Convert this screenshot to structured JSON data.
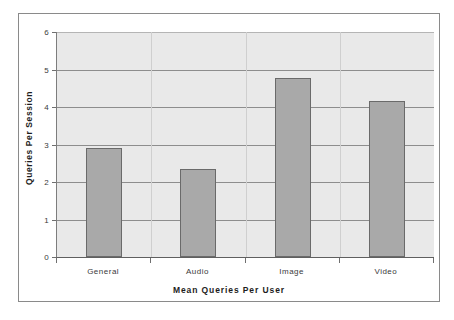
{
  "chart_data": {
    "type": "bar",
    "title": "",
    "subtitle": "",
    "categories": [
      "General",
      "Audio",
      "Image",
      "Video"
    ],
    "values": [
      2.9,
      2.35,
      4.78,
      4.17
    ],
    "xlabel": "Mean Queries Per User",
    "ylabel": "Queries Per Session",
    "ylim": [
      0,
      6
    ],
    "yticks": [
      0,
      1,
      2,
      3,
      4,
      5,
      6
    ],
    "ytick_labels": [
      "0",
      "1",
      "2",
      "3",
      "4",
      "5",
      "6"
    ],
    "grid": true,
    "grid_axis": "y",
    "legend": false,
    "legend_position": "none",
    "bar_color": "#a9a9a9",
    "bar_edge_color": "#6a6a6a",
    "plot_background": "#e9e9e9",
    "gridline_color": "#8d8d8d",
    "frame_color": "#8a8a8a",
    "text_color": "#3a3a3a",
    "axis_title_color": "#1d1d1d"
  }
}
